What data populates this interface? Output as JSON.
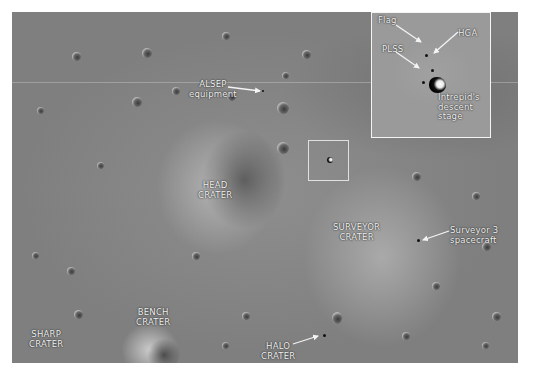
{
  "image": {
    "subject": "Apollo 12 landing site, lunar surface overhead view",
    "background_color": "#ffffff",
    "surface_color": "#888888",
    "label_color": "#f2f2f2"
  },
  "labels": {
    "alsep": [
      "ALSEP",
      "equipment"
    ],
    "head_crater": [
      "HEAD",
      "CRATER"
    ],
    "surveyor_crater": [
      "SURVEYOR",
      "CRATER"
    ],
    "surveyor_spacecraft": [
      "Surveyor 3",
      "spacecraft"
    ],
    "bench_crater": [
      "BENCH",
      "CRATER"
    ],
    "sharp_crater": [
      "SHARP",
      "CRATER"
    ],
    "halo_crater": [
      "HALO",
      "CRATER"
    ]
  },
  "inset": {
    "labels": {
      "flag": "Flag",
      "hga": "HGA",
      "plss": "PLSS",
      "descent_stage": [
        "Intrepid's",
        "descent stage"
      ]
    }
  }
}
